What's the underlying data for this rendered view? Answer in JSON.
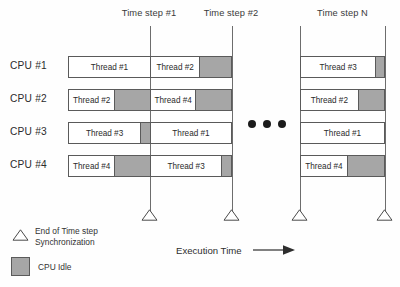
{
  "diagram": {
    "title_hidden": "",
    "time_steps": [
      {
        "label": "Time step #1",
        "x": 108,
        "width": 82
      },
      {
        "label": "Time step #2",
        "x": 190,
        "width": 82
      },
      {
        "label": "Time step N",
        "x": 300,
        "width": 85
      }
    ],
    "sync_rules": [
      {
        "x": 150
      },
      {
        "x": 232
      },
      {
        "x": 300
      },
      {
        "x": 385
      }
    ],
    "sync_markers": [
      {
        "x": 150
      },
      {
        "x": 232
      },
      {
        "x": 300
      },
      {
        "x": 385
      }
    ],
    "cpus": [
      {
        "label": "CPU #1",
        "y": 56,
        "left_bar": {
          "x": 68,
          "width": 164,
          "segments": [
            {
              "kind": "thread",
              "label": "Thread #1",
              "width": 82
            },
            {
              "kind": "thread",
              "label": "Thread #2",
              "width": 50
            },
            {
              "kind": "idle",
              "label": "",
              "width": 32
            }
          ]
        },
        "right_bar": {
          "x": 300,
          "width": 85,
          "segments": [
            {
              "kind": "thread",
              "label": "Thread #3",
              "width": 76
            },
            {
              "kind": "idle",
              "label": "",
              "width": 9
            }
          ]
        }
      },
      {
        "label": "CPU #2",
        "y": 89,
        "left_bar": {
          "x": 68,
          "width": 164,
          "segments": [
            {
              "kind": "thread",
              "label": "Thread #2",
              "width": 46
            },
            {
              "kind": "idle",
              "label": "",
              "width": 36
            },
            {
              "kind": "thread",
              "label": "Thread #4",
              "width": 46
            },
            {
              "kind": "idle",
              "label": "",
              "width": 36
            }
          ]
        },
        "right_bar": {
          "x": 300,
          "width": 85,
          "segments": [
            {
              "kind": "thread",
              "label": "Thread #2",
              "width": 58
            },
            {
              "kind": "idle",
              "label": "",
              "width": 27
            }
          ]
        }
      },
      {
        "label": "CPU #3",
        "y": 122,
        "left_bar": {
          "x": 68,
          "width": 164,
          "segments": [
            {
              "kind": "thread",
              "label": "Thread #3",
              "width": 72
            },
            {
              "kind": "idle",
              "label": "",
              "width": 10
            },
            {
              "kind": "thread",
              "label": "Thread #1",
              "width": 82
            }
          ]
        },
        "right_bar": {
          "x": 300,
          "width": 85,
          "segments": [
            {
              "kind": "thread",
              "label": "Thread #1",
              "width": 85
            }
          ]
        }
      },
      {
        "label": "CPU #4",
        "y": 155,
        "left_bar": {
          "x": 68,
          "width": 164,
          "segments": [
            {
              "kind": "thread",
              "label": "Thread #4",
              "width": 46
            },
            {
              "kind": "idle",
              "label": "",
              "width": 36
            },
            {
              "kind": "thread",
              "label": "Thread #3",
              "width": 72
            },
            {
              "kind": "idle",
              "label": "",
              "width": 10
            }
          ]
        },
        "right_bar": {
          "x": 300,
          "width": 85,
          "segments": [
            {
              "kind": "thread",
              "label": "Thread #4",
              "width": 47
            },
            {
              "kind": "idle",
              "label": "",
              "width": 38
            }
          ]
        }
      }
    ],
    "continuation": {
      "dots": 3
    },
    "legend": {
      "sync": {
        "icon": "triangle-up-outline",
        "label": "End of Time step\n Synchronization"
      },
      "idle": {
        "icon": "gray-square",
        "label": "CPU Idle"
      }
    },
    "axis": {
      "label": "Execution Time",
      "arrow": "arrow-right"
    },
    "colors": {
      "idle_fill": "#a6a6a6",
      "bar_stroke": "#5a5a5a",
      "rule_stroke": "#6d6d6d",
      "text": "#2b2b2b",
      "dot_fill": "#1b1b1b"
    }
  }
}
